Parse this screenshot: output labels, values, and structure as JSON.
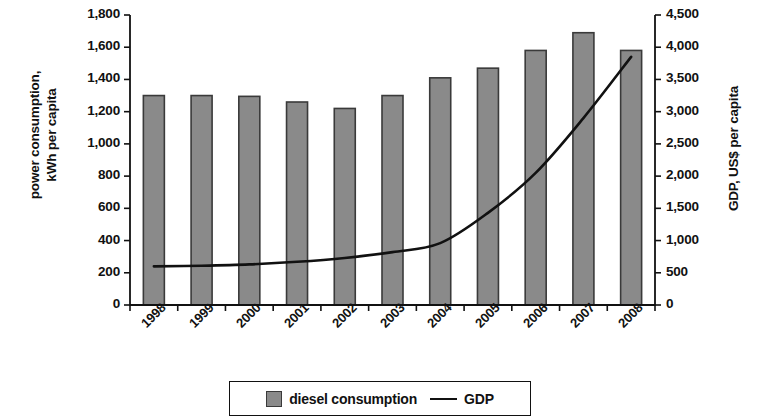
{
  "chart_data": {
    "type": "bar",
    "title": "",
    "subtitle": "",
    "xlabel": "",
    "ylabel": "power consumption,\nkWh per capita",
    "y2label": "GDP, US$ per capita",
    "categories": [
      "1998",
      "1999",
      "2000",
      "2001",
      "2002",
      "2003",
      "2004",
      "2005",
      "2006",
      "2007",
      "2008"
    ],
    "ylim": [
      0,
      1800
    ],
    "y2lim": [
      0,
      4500
    ],
    "yticks": [
      "0",
      "200",
      "400",
      "600",
      "800",
      "1,000",
      "1,200",
      "1,400",
      "1,600",
      "1,800"
    ],
    "ytick_values": [
      0,
      200,
      400,
      600,
      800,
      1000,
      1200,
      1400,
      1600,
      1800
    ],
    "y2ticks": [
      "0",
      "500",
      "1,000",
      "1,500",
      "2,000",
      "2,500",
      "3,000",
      "3,500",
      "4,000",
      "4,500"
    ],
    "y2tick_values": [
      0,
      500,
      1000,
      1500,
      2000,
      2500,
      3000,
      3500,
      4000,
      4500
    ],
    "grid": false,
    "legend_position": "bottom",
    "series": [
      {
        "name": "diesel consumption",
        "type": "bar",
        "axis": "left",
        "color": "#8a8a8a",
        "edge_color": "#3a3a3a",
        "values": [
          1300,
          1300,
          1295,
          1260,
          1220,
          1300,
          1410,
          1470,
          1580,
          1690,
          1580
        ]
      },
      {
        "name": "GDP",
        "type": "line",
        "axis": "right",
        "color": "#111111",
        "values": [
          600,
          610,
          630,
          670,
          730,
          820,
          960,
          1430,
          2050,
          2900,
          3850
        ]
      }
    ]
  },
  "legend": {
    "items": [
      {
        "label": "diesel consumption",
        "marker": "square"
      },
      {
        "label": "GDP",
        "marker": "line"
      }
    ]
  }
}
